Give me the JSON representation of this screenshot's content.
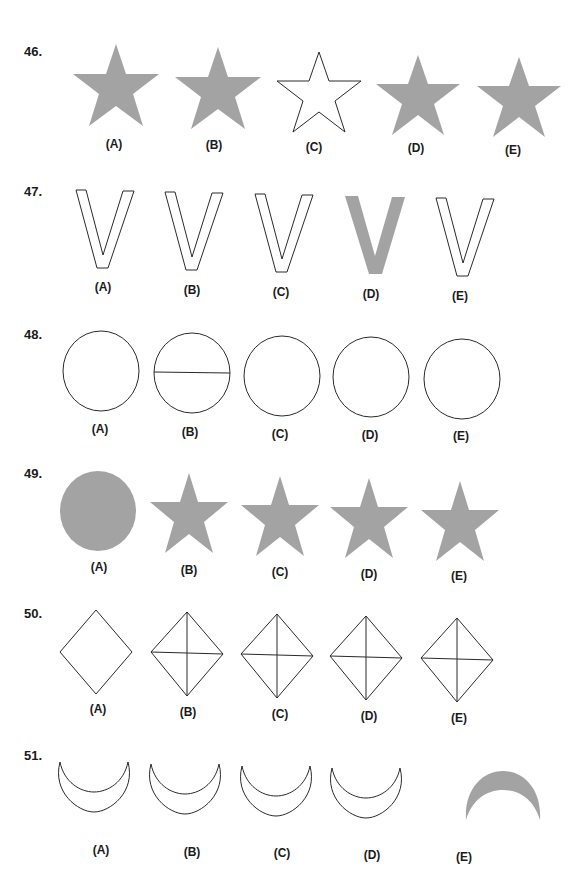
{
  "colors": {
    "fill_gray": "#a3a3a3",
    "stroke": "#2a2a2a",
    "background": "#ffffff"
  },
  "questions": [
    {
      "number": "46.",
      "shapes": [
        "filled-star",
        "filled-star",
        "outline-star",
        "filled-star",
        "filled-star"
      ],
      "options": [
        "(A)",
        "(B)",
        "(C)",
        "(D)",
        "(E)"
      ]
    },
    {
      "number": "47.",
      "shapes": [
        "outline-v",
        "outline-v",
        "outline-v",
        "filled-v",
        "outline-v"
      ],
      "options": [
        "(A)",
        "(B)",
        "(C)",
        "(D)",
        "(E)"
      ]
    },
    {
      "number": "48.",
      "shapes": [
        "circle",
        "circle-with-line",
        "circle",
        "circle",
        "circle"
      ],
      "options": [
        "(A)",
        "(B)",
        "(C)",
        "(D)",
        "(E)"
      ]
    },
    {
      "number": "49.",
      "shapes": [
        "filled-circle",
        "filled-star",
        "filled-star",
        "filled-star",
        "filled-star"
      ],
      "options": [
        "(A)",
        "(B)",
        "(C)",
        "(D)",
        "(E)"
      ]
    },
    {
      "number": "50.",
      "shapes": [
        "diamond",
        "diamond-crossed",
        "diamond-crossed",
        "diamond-crossed",
        "diamond-crossed"
      ],
      "options": [
        "(A)",
        "(B)",
        "(C)",
        "(D)",
        "(E)"
      ]
    },
    {
      "number": "51.",
      "shapes": [
        "outline-crescent",
        "outline-crescent",
        "outline-crescent",
        "outline-crescent",
        "filled-crescent-inverted"
      ],
      "options": [
        "(A)",
        "(B)",
        "(C)",
        "(D)",
        "(E)"
      ]
    }
  ]
}
